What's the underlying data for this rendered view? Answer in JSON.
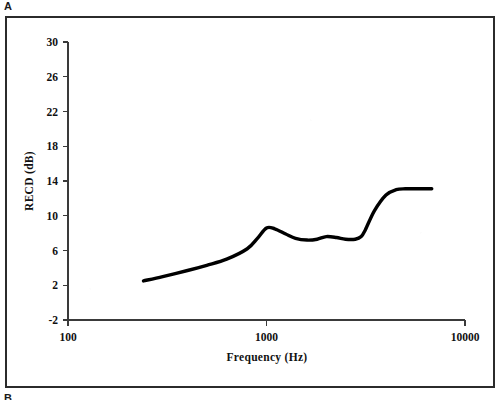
{
  "figure": {
    "panel_label_top": "A",
    "panel_label_bottom": "B"
  },
  "chart_data": {
    "type": "line",
    "title": "",
    "xlabel": "Frequency (Hz)",
    "ylabel": "RECD (dB)",
    "xscale": "log",
    "xlim": [
      100,
      10000
    ],
    "ylim": [
      -2,
      30
    ],
    "grid": false,
    "legend": null,
    "xtick_labels": [
      "100",
      "1000",
      "10000"
    ],
    "xticks": [
      100,
      1000,
      10000
    ],
    "ytick_labels": [
      "30",
      "26",
      "22",
      "18",
      "14",
      "10",
      "6",
      "2",
      "-2"
    ],
    "yticks": [
      30,
      26,
      22,
      18,
      14,
      10,
      6,
      2,
      -2
    ],
    "series": [
      {
        "name": "RECD",
        "color": "#000000",
        "x": [
          240,
          300,
          400,
          500,
          630,
          800,
          900,
          1000,
          1100,
          1250,
          1400,
          1600,
          1800,
          2000,
          2250,
          2500,
          2800,
          3000,
          3150,
          3500,
          4000,
          4500,
          5000,
          5600,
          6300,
          6800
        ],
        "y": [
          2.5,
          3.0,
          3.7,
          4.3,
          5.0,
          6.2,
          7.4,
          8.6,
          8.5,
          7.9,
          7.4,
          7.2,
          7.3,
          7.6,
          7.5,
          7.3,
          7.3,
          7.6,
          8.4,
          10.6,
          12.4,
          13.0,
          13.1,
          13.1,
          13.1,
          13.1
        ]
      }
    ]
  }
}
